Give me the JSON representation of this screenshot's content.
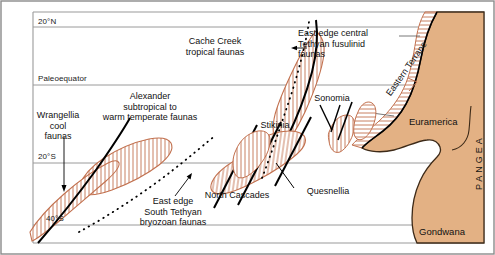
{
  "figure": {
    "frame_color": "#8a8a8a",
    "background_color": "#ffffff"
  },
  "colors": {
    "land_fill": "#e3b184",
    "land_outline": "#3d2a18",
    "terrane_outline": "#c2714f",
    "hatch": "#c2714f",
    "latitude_line": "#9a9a9a",
    "fault_line": "#000000",
    "dotted_line": "#000000",
    "text": "#111111"
  },
  "latitudes": [
    {
      "id": "lat-20n",
      "label": "20°N",
      "y": 27
    },
    {
      "id": "lat-equator",
      "label": "Paleoequator",
      "y": 85
    },
    {
      "id": "lat-20s",
      "label": "20°S",
      "y": 163
    },
    {
      "id": "lat-40s",
      "label": "40°S",
      "y": 225
    }
  ],
  "terranes": [
    {
      "id": "wrangellia",
      "label": "Wrangellia\ncool\nfaunas",
      "label_lines": [
        "Wrangellia",
        "cool",
        "faunas"
      ],
      "has_leader": true
    },
    {
      "id": "alexander",
      "label": "Alexander\nsubtropical to\nwarm temperate faunas",
      "label_lines": [
        "Alexander",
        "subtropical to",
        "warm temperate faunas"
      ],
      "has_leader": false
    },
    {
      "id": "cache-creek",
      "label": "Cache Creek\ntropical faunas",
      "label_lines": [
        "Cache Creek",
        "tropical faunas"
      ],
      "has_leader": false
    },
    {
      "id": "stikinia",
      "label": "Stikinia",
      "label_lines": [
        "Stikinia"
      ],
      "has_leader": false
    },
    {
      "id": "quesnellia",
      "label": "Quesnellia",
      "label_lines": [
        "Quesnellia"
      ],
      "has_leader": false
    },
    {
      "id": "north-cascades",
      "label": "North Cascades",
      "label_lines": [
        "North Cascades"
      ],
      "has_leader": true
    },
    {
      "id": "sonomia",
      "label": "Sonomia",
      "label_lines": [
        "Sonomia"
      ],
      "has_leader": true
    },
    {
      "id": "eastern-terrane",
      "label": "Eastern Terrane",
      "label_lines": [
        "Eastern Terrane"
      ],
      "has_leader": true,
      "rotation_deg": -55
    }
  ],
  "faunal_boundaries": [
    {
      "id": "east-edge-central-tethyan",
      "label_lines": [
        "East edge central",
        "Tethyan fusulinid",
        "faunas"
      ],
      "label": "East edge central Tethyan fusulinid faunas",
      "style": "dotted",
      "has_leader": true
    },
    {
      "id": "east-edge-south-tethyan",
      "label_lines": [
        "East edge",
        "South Tethyan",
        "bryozoan faunas"
      ],
      "label": "East edge South Tethyan bryozoan faunas",
      "style": "dotted",
      "has_leader": true
    }
  ],
  "continents": [
    {
      "id": "euramerica",
      "label": "Euramerica"
    },
    {
      "id": "gondwana",
      "label": "Gondwana"
    },
    {
      "id": "pangea",
      "label": "PANGEA",
      "orientation": "vertical"
    }
  ]
}
